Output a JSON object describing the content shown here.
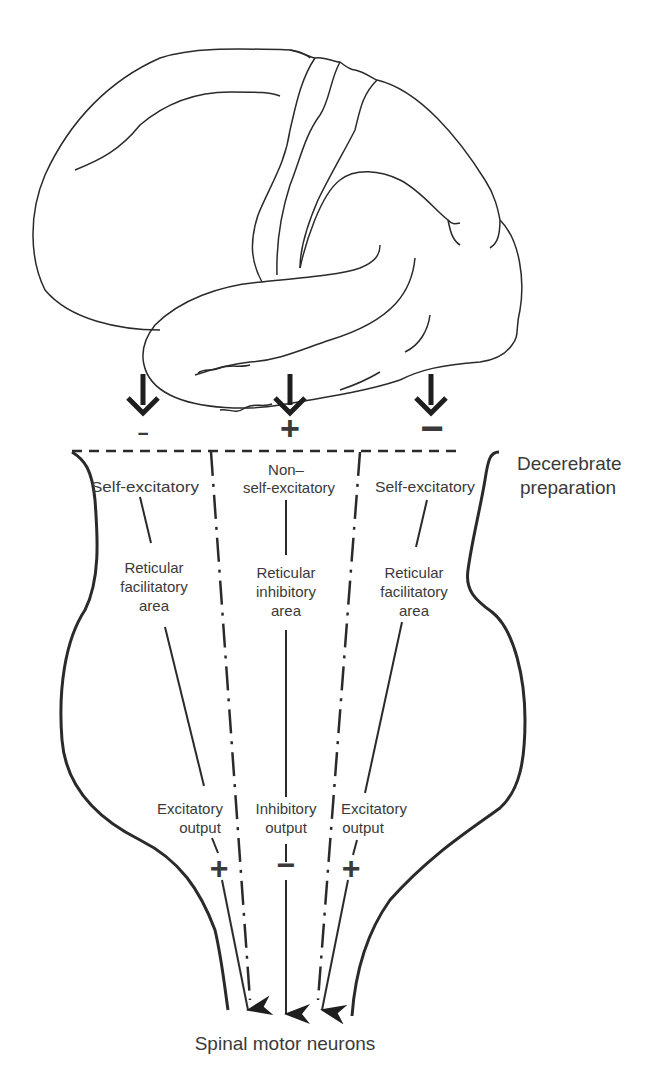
{
  "diagram": {
    "brain": {
      "label": "cerebral-hemisphere-outline"
    },
    "cortical_inputs": [
      {
        "arrow": "down",
        "sign": "−"
      },
      {
        "arrow": "down",
        "sign": "+"
      },
      {
        "arrow": "down",
        "sign": "−"
      }
    ],
    "section_label": {
      "line1": "Decerebrate",
      "line2": "preparation"
    },
    "columns": [
      {
        "top": "Self-excitatory",
        "area": [
          "Reticular",
          "facilitatory",
          "area"
        ],
        "output": [
          "Excitatory",
          "output"
        ],
        "output_sign": "+"
      },
      {
        "top_line1": "Non–",
        "top_line2": "self-excitatory",
        "area": [
          "Reticular",
          "inhibitory",
          "area"
        ],
        "output": [
          "Inhibitory",
          "output"
        ],
        "output_sign": "−"
      },
      {
        "top": "Self-excitatory",
        "area": [
          "Reticular",
          "facilitatory",
          "area"
        ],
        "output": [
          "Excitatory",
          "output"
        ],
        "output_sign": "+"
      }
    ],
    "target_label": "Spinal motor neurons",
    "colors": {
      "ink": "#2a2a2a",
      "text": "#3a3a3a",
      "background": "#ffffff"
    }
  }
}
